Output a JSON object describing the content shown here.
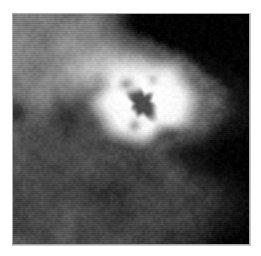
{
  "page": {
    "width": 261,
    "height": 256,
    "background_color": "#ffffff",
    "margin_left": 12,
    "margin_top": 13
  },
  "scan": {
    "title": "",
    "frame_border_color": "#a8a8a8",
    "shadow_color": "#c9c9c9",
    "background_color": "#000000",
    "width": 238,
    "height": 232,
    "modality": "grayscale-radiograph",
    "overlay_text": "",
    "annotations": [],
    "palette": {
      "black": "#000000",
      "deep_shadow": "#0d0d0d",
      "dark_tissue": "#3a3a3a",
      "mid_tissue": "#6e6e6e",
      "light_tissue": "#9a9a9a",
      "bright_tissue": "#c8c8c8",
      "mass_bright": "#ededed",
      "mass_peak": "#fbfbfb",
      "core_dark": "#4a4a4a"
    },
    "regions": [
      {
        "name": "background-air",
        "description": "black air region on right side of frame",
        "gray_level": 4
      },
      {
        "name": "tissue-body",
        "description": "dense fibroglandular tissue filling left two thirds",
        "gray_level": 110
      },
      {
        "name": "bright-mass",
        "description": "rounded high-density mass upper center",
        "center_x": 143,
        "center_y": 97,
        "radius_x": 58,
        "radius_y": 52,
        "gray_level": 244
      },
      {
        "name": "mass-core",
        "description": "irregular dark core inside the bright mass",
        "center_x": 142,
        "center_y": 103,
        "gray_level": 74
      },
      {
        "name": "lower-lobe",
        "description": "rounded tissue lobe protruding lower right",
        "center_x": 150,
        "center_y": 195,
        "gray_level": 70
      },
      {
        "name": "upper-streak",
        "description": "bright diagonal band across upper left",
        "gray_level": 185
      },
      {
        "name": "dark-patch-left",
        "description": "darker lucent patch mid left",
        "gray_level": 72
      }
    ]
  }
}
